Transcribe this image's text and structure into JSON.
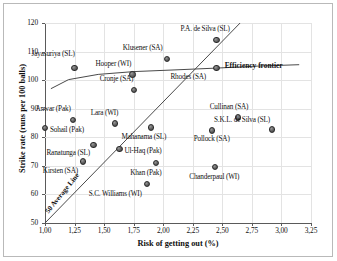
{
  "chart_data": {
    "type": "scatter",
    "title": "",
    "xlabel": "Risk of getting out (%)",
    "ylabel": "Strike rate (runs per 100 balls)",
    "xlim": [
      1.0,
      3.25
    ],
    "ylim": [
      50,
      120
    ],
    "xticks": [
      "1,00",
      "1,25",
      "1,50",
      "1,75",
      "2,00",
      "2,25",
      "2,50",
      "2,75",
      "3,00",
      "3,25"
    ],
    "xtick_values": [
      1.0,
      1.25,
      1.5,
      1.75,
      2.0,
      2.25,
      2.5,
      2.75,
      3.0,
      3.25
    ],
    "yticks": [
      "50",
      "60",
      "70",
      "80",
      "90",
      "100",
      "110",
      "120"
    ],
    "ytick_values": [
      50,
      60,
      70,
      80,
      90,
      100,
      110,
      120
    ],
    "grid": true,
    "legend": "none",
    "points": [
      {
        "label": "Jayasuriya (SL)",
        "x": 1.25,
        "y": 104.2,
        "lx": -43,
        "ly": -13
      },
      {
        "label": "Sohail (Pak)",
        "x": 1.0,
        "y": 83.3,
        "lx": 5,
        "ly": 3
      },
      {
        "label": "Anwar (Pak)",
        "x": 1.24,
        "y": 86.0,
        "lx": -38,
        "ly": -10
      },
      {
        "label": "Ranatunga (SL)",
        "x": 1.41,
        "y": 77.4,
        "lx": -47,
        "ly": 9
      },
      {
        "label": "Kirsten (SA)",
        "x": 1.32,
        "y": 71.5,
        "lx": -40,
        "ly": 10
      },
      {
        "label": "Lara (WI)",
        "x": 1.59,
        "y": 84.8,
        "lx": -24,
        "ly": -10
      },
      {
        "label": "Ul-Haq (Pak)",
        "x": 1.63,
        "y": 76.0,
        "lx": 5,
        "ly": 3
      },
      {
        "label": "Cronje (SA)",
        "x": 1.75,
        "y": 96.5,
        "lx": -34,
        "ly": -10
      },
      {
        "label": "Hooper (WI)",
        "x": 1.74,
        "y": 102.0,
        "lx": -37,
        "ly": -9
      },
      {
        "label": "S.C. Williams (WI)",
        "x": 1.86,
        "y": 63.6,
        "lx": -58,
        "ly": 11
      },
      {
        "label": "Mahanama (SL)",
        "x": 1.9,
        "y": 83.4,
        "lx": -30,
        "ly": 10
      },
      {
        "label": "Khan (Pak)",
        "x": 1.94,
        "y": 70.9,
        "lx": -26,
        "ly": 11
      },
      {
        "label": "Klusener (SA)",
        "x": 2.03,
        "y": 107.4,
        "lx": -44,
        "ly": -10
      },
      {
        "label": "Pollock (SA)",
        "x": 2.41,
        "y": 82.4,
        "lx": -18,
        "ly": 10
      },
      {
        "label": "Chanderpaul (WI)",
        "x": 2.44,
        "y": 69.6,
        "lx": -26,
        "ly": 11
      },
      {
        "label": "Rhodes (SA)",
        "x": 2.45,
        "y": 104.2,
        "lx": -46,
        "ly": 10
      },
      {
        "label": "P.A. de Silva (SL)",
        "x": 2.45,
        "y": 114.0,
        "lx": -36,
        "ly": -10
      },
      {
        "label": "Cullinan (SA)",
        "x": 2.63,
        "y": 86.9,
        "lx": -28,
        "ly": -10
      },
      {
        "label": "S.K.L. de Silva (SL)",
        "x": 2.92,
        "y": 82.7,
        "lx": -58,
        "ly": -9
      }
    ],
    "annotations": [
      {
        "name": "efficiency-frontier",
        "text": "Efficiency frontier"
      },
      {
        "name": "average-line",
        "text": "50 Average Line"
      }
    ],
    "series_lines": [
      {
        "name": "efficiency-frontier",
        "points": [
          [
            1.05,
            97.0
          ],
          [
            1.2,
            100.2
          ],
          [
            1.45,
            102.0
          ],
          [
            1.75,
            103.0
          ],
          [
            2.1,
            103.6
          ],
          [
            2.45,
            104.2
          ],
          [
            2.8,
            104.9
          ],
          [
            3.15,
            105.4
          ]
        ]
      },
      {
        "name": "average-line",
        "points": [
          [
            1.0,
            50.0
          ],
          [
            2.65,
            120.0
          ]
        ]
      }
    ],
    "marker_color": "#5a5a5a",
    "line_color": "#4a4a4a",
    "grid_color": "#e3e3e3"
  }
}
